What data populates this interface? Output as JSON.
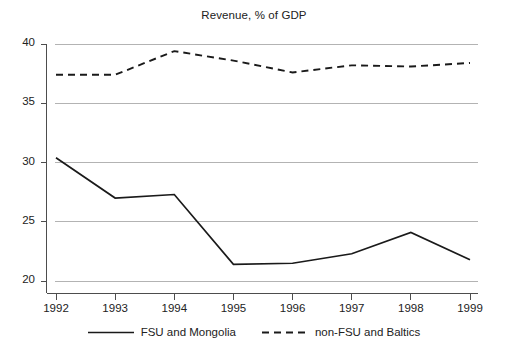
{
  "chart_data": {
    "type": "line",
    "title": "Revenue, % of GDP",
    "xlabel": "",
    "ylabel": "",
    "categories": [
      "1992",
      "1993",
      "1994",
      "1995",
      "1996",
      "1997",
      "1998",
      "1999"
    ],
    "x": [
      1992,
      1993,
      1994,
      1995,
      1996,
      1997,
      1998,
      1999
    ],
    "xlim": [
      1991.75,
      1999.15
    ],
    "ylim": [
      18.8,
      40.8
    ],
    "yticks": [
      20,
      25,
      30,
      35,
      40
    ],
    "ytick_labels": [
      "20",
      "25",
      "30",
      "35",
      "40"
    ],
    "grid": "horizontal",
    "legend_position": "bottom-center",
    "series": [
      {
        "name": "FSU and Mongolia",
        "style": "solid",
        "color": "#1a1a1a",
        "values": [
          30.4,
          27.0,
          27.3,
          21.4,
          21.5,
          22.3,
          24.1,
          21.8
        ]
      },
      {
        "name": "non-FSU and Baltics",
        "style": "dashed",
        "color": "#1a1a1a",
        "values": [
          37.4,
          37.4,
          39.4,
          38.6,
          37.6,
          38.2,
          38.1,
          38.4
        ]
      }
    ]
  },
  "colors": {
    "axis": "#4d4d4d",
    "grid": "#b3b3b3",
    "line": "#1a1a1a",
    "text": "#222222",
    "background": "#ffffff"
  }
}
